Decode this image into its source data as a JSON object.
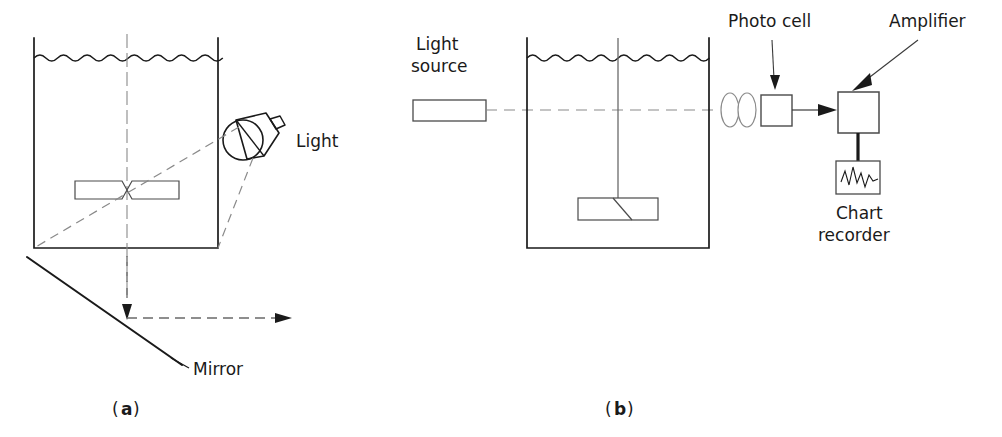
{
  "figure": {
    "panels": [
      {
        "id": "a",
        "caption_open": "(",
        "caption_letter": "a",
        "caption_close": ")",
        "description": "Light beam through stirred tank reflected by angled mirror",
        "labels": {
          "light": "Light",
          "mirror": "Mirror"
        }
      },
      {
        "id": "b",
        "caption_open": "(",
        "caption_letter": "b",
        "caption_close": ")",
        "description": "Light source, stirred tank, lenses, photo cell, amplifier and chart recorder",
        "labels": {
          "light_source_line1": "Light",
          "light_source_line2": "source",
          "photo_cell": "Photo cell",
          "amplifier": "Amplifier",
          "chart_recorder_line1": "Chart",
          "chart_recorder_line2": "recorder"
        }
      }
    ],
    "colors": {
      "background": "#ffffff",
      "stroke_dark": "#1a1a1a",
      "stroke_medium": "#4a4a4a",
      "stroke_light": "#777777",
      "dashed_ray": "#8a8a8a"
    }
  }
}
